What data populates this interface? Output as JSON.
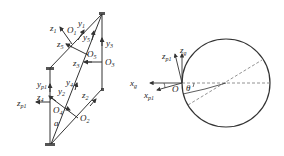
{
  "left_diagram": {
    "labels": {
      "z1": {
        "base": "z",
        "sub": "1"
      },
      "y1": {
        "base": "y",
        "sub": "1"
      },
      "O1": {
        "base": "O",
        "sub": "1"
      },
      "y5": {
        "base": "y",
        "sub": "5"
      },
      "z5": {
        "base": "z",
        "sub": "5"
      },
      "O5": {
        "base": "O",
        "sub": "5"
      },
      "y3": {
        "base": "y",
        "sub": "3"
      },
      "z3": {
        "base": "z",
        "sub": "3"
      },
      "O3": {
        "base": "O",
        "sub": "3"
      },
      "yp1": {
        "base": "y",
        "sub": "p1"
      },
      "y4": {
        "base": "y",
        "sub": "4"
      },
      "y2": {
        "base": "y",
        "sub": "2"
      },
      "z4": {
        "base": "z",
        "sub": "4"
      },
      "zp1": {
        "base": "z",
        "sub": "p1"
      },
      "O4": {
        "base": "O",
        "sub": "4"
      },
      "z2": {
        "base": "z",
        "sub": "2"
      },
      "O2": {
        "base": "O",
        "sub": "2"
      },
      "a": {
        "base": "a",
        "sub": ""
      }
    }
  },
  "right_diagram": {
    "labels": {
      "zp1": {
        "base": "z",
        "sub": "p1"
      },
      "zg": {
        "base": "z",
        "sub": "g"
      },
      "xg": {
        "base": "x",
        "sub": "g"
      },
      "xp1": {
        "base": "x",
        "sub": "p1"
      },
      "O": {
        "base": "O",
        "sub": ""
      },
      "theta": {
        "base": "θ",
        "sub": ""
      }
    }
  },
  "colors": {
    "line": "#333333",
    "dashed": "#666666",
    "background": "#ffffff"
  }
}
